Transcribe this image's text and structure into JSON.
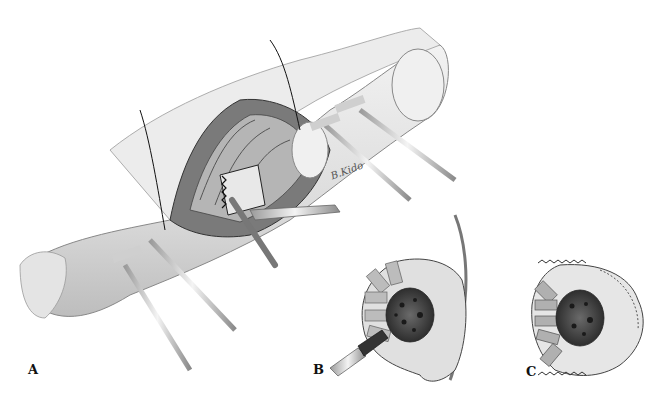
{
  "figure": {
    "type": "surgical illustration",
    "panels": [
      {
        "label": "A",
        "description": "Open surgical exposure of upper arm with bone osteotomy, retractors and external fixation pins"
      },
      {
        "label": "B",
        "description": "Cross-section showing bone with lesion, radiating segments and instrument"
      },
      {
        "label": "C",
        "description": "Cross-section with serrated saw edges around bone lesion"
      }
    ],
    "signature": "B.Kido",
    "colors": {
      "background": "#ffffff",
      "ink": "#1a1a1a",
      "shade_light": "#e6e6e6",
      "shade_mid": "#a8a8a8",
      "shade_dark": "#4a4a4a"
    }
  }
}
